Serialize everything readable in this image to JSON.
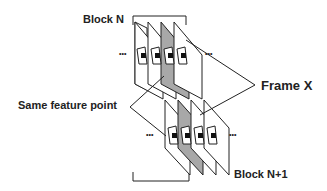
{
  "diagram": {
    "labels": {
      "block_top": "Block N",
      "block_bottom": "Block N+1",
      "frame_x": "Frame X",
      "same_feature": "Same feature point"
    },
    "blocks": [
      {
        "name": "Block N",
        "frames": 4,
        "highlighted_frame_index": 2
      },
      {
        "name": "Block N+1",
        "frames": 4,
        "highlighted_frame_index": 1
      }
    ],
    "colors": {
      "line": "#222222",
      "highlight_fill": "#a8a8a8",
      "background": "#ffffff"
    },
    "ellipsis": "•••"
  }
}
